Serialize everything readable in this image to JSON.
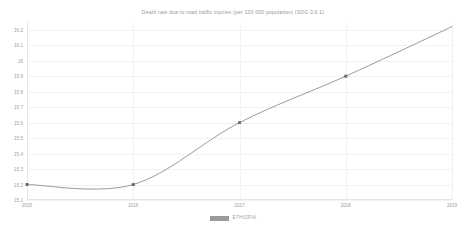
{
  "chart_data": {
    "type": "line",
    "title": "Death rate due to road traffic injuries (per 100 000 population) (SDG 3.6.1)",
    "xlabel": "",
    "ylabel": "",
    "x": [
      2015,
      2016,
      2017,
      2018,
      2019
    ],
    "series": [
      {
        "name": "ETHIOPIA",
        "color": "#8f8f8f",
        "values": [
          15.2,
          15.2,
          15.6,
          15.9,
          16.22
        ]
      }
    ],
    "categories": [
      "2015",
      "2016",
      "2017",
      "2018",
      "2019"
    ],
    "xtick_labels": [
      "2015",
      "2016",
      "2017",
      "2018",
      "2019"
    ],
    "ytick_labels": [
      "16.2",
      "16.1",
      "16",
      "15.9",
      "15.8",
      "15.7",
      "15.6",
      "15.5",
      "15.4",
      "15.3",
      "15.2",
      "15.1"
    ],
    "ytick_values": [
      16.2,
      16.1,
      16.0,
      15.9,
      15.8,
      15.7,
      15.6,
      15.5,
      15.4,
      15.3,
      15.2,
      15.1
    ],
    "ylim": [
      15.1,
      16.25
    ],
    "xlim": [
      2015,
      2019
    ],
    "grid": true,
    "legend_position": "bottom",
    "markers": true,
    "curve": "smooth"
  },
  "legend": {
    "entries": [
      {
        "label": "ETHIOPIA",
        "color": "#9b9b9b"
      }
    ]
  }
}
